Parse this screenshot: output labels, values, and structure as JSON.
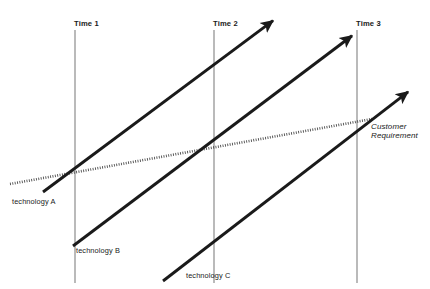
{
  "diagram": {
    "type": "technology-progression-timeline",
    "background_color": "#ffffff",
    "arrow_color": "#1a1a1a",
    "axis_color": "#8c8c8c",
    "dotted_color": "#4d4d4d",
    "text_color": "#1a1a1a"
  },
  "time_markers": [
    {
      "id": "time-1",
      "label": "Time 1",
      "x": 75,
      "y_top": 30,
      "y_bottom": 283,
      "label_x": 74,
      "label_y": 20
    },
    {
      "id": "time-2",
      "label": "Time 2",
      "x": 214,
      "y_top": 30,
      "y_bottom": 283,
      "label_x": 213,
      "label_y": 20
    },
    {
      "id": "time-3",
      "label": "Time 3",
      "x": 357,
      "y_top": 30,
      "y_bottom": 283,
      "label_x": 356,
      "label_y": 20
    }
  ],
  "technology_curves": [
    {
      "id": "technology-a",
      "label": "technology A",
      "x1": 43,
      "y1": 192,
      "x2": 278,
      "y2": 17,
      "label_x": 12,
      "label_y": 196
    },
    {
      "id": "technology-b",
      "label": "technology B",
      "x1": 73,
      "y1": 246,
      "x2": 357,
      "y2": 32,
      "label_x": 76,
      "label_y": 246
    },
    {
      "id": "technology-c",
      "label": "technology C",
      "x1": 163,
      "y1": 281,
      "x2": 413,
      "y2": 88,
      "label_x": 186,
      "label_y": 271
    }
  ],
  "customer_requirement": {
    "id": "customer-requirement",
    "label_line_1": "Customer",
    "label_line_2": "Requirement",
    "x1": 10,
    "y1": 184,
    "x2": 372,
    "y2": 119,
    "label_x": 371,
    "label_y": 122,
    "style": "dotted"
  }
}
